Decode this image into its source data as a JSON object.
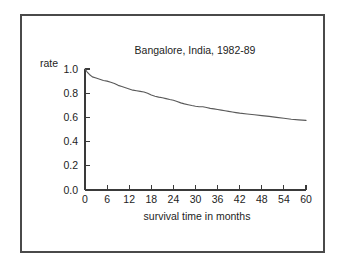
{
  "figure": {
    "border_color": "#4a4a4a",
    "background_color": "#ffffff"
  },
  "chart_data": {
    "type": "line",
    "title": "Bangalore, India, 1982-89",
    "xlabel": "survival time in months",
    "ylabel": "rate",
    "xlim": [
      0,
      60
    ],
    "ylim": [
      0.0,
      1.0
    ],
    "grid": false,
    "legend": "none",
    "line_color": "#5a5a5a",
    "xticks": [
      0,
      6,
      12,
      18,
      24,
      30,
      36,
      42,
      48,
      54,
      60
    ],
    "xtick_labels": [
      "0",
      "6",
      "12",
      "18",
      "24",
      "30",
      "36",
      "42",
      "48",
      "54",
      "60"
    ],
    "yticks": [
      0.0,
      0.2,
      0.4,
      0.6,
      0.8,
      1.0
    ],
    "ytick_labels": [
      "0.0",
      "0.2",
      "0.4",
      "0.6",
      "0.8",
      "1.0"
    ],
    "series": [
      {
        "name": "survival rate",
        "x": [
          0,
          0.6,
          1.2,
          2,
          3,
          4,
          5,
          6,
          7,
          8,
          9,
          10,
          11,
          12,
          13,
          14,
          15,
          16,
          17,
          18,
          19,
          20,
          21,
          22,
          23,
          24,
          25,
          26,
          27,
          28,
          29,
          30,
          31,
          32,
          33,
          34,
          35,
          36,
          37,
          38,
          39,
          40,
          41,
          42,
          44,
          46,
          48,
          50,
          52,
          54,
          56,
          58,
          60
        ],
        "values": [
          1.0,
          0.975,
          0.955,
          0.935,
          0.925,
          0.915,
          0.905,
          0.9,
          0.89,
          0.88,
          0.865,
          0.855,
          0.845,
          0.835,
          0.825,
          0.82,
          0.815,
          0.81,
          0.8,
          0.785,
          0.775,
          0.768,
          0.762,
          0.755,
          0.748,
          0.742,
          0.732,
          0.72,
          0.712,
          0.705,
          0.698,
          0.692,
          0.688,
          0.688,
          0.682,
          0.675,
          0.67,
          0.665,
          0.66,
          0.655,
          0.65,
          0.645,
          0.64,
          0.635,
          0.628,
          0.622,
          0.615,
          0.608,
          0.6,
          0.593,
          0.585,
          0.58,
          0.575
        ]
      }
    ]
  }
}
